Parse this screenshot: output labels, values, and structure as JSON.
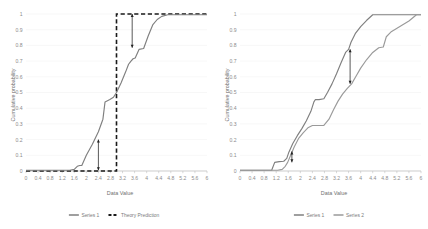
{
  "figure": {
    "panel_count": 2,
    "background": "#ffffff",
    "line_color": "#7f7f7f",
    "line_color_secondary": "#9a9a9a",
    "theory_color": "#1a1a1a",
    "gridline_color": "#f2f2f2",
    "axis_color": "#bfbfbf",
    "tick_text_color": "#8c8c8c"
  },
  "chart_data": [
    {
      "type": "line",
      "panel": "left",
      "title": "",
      "xlabel": "Data Value",
      "ylabel": "Cumulative probability",
      "xlim": [
        0,
        6
      ],
      "ylim": [
        0,
        1
      ],
      "grid": true,
      "legend_position": "bottom",
      "xticks": [
        "0",
        "0.4",
        "0.8",
        "1.2",
        "1.6",
        "2",
        "2.4",
        "2.8",
        "3.2",
        "3.6",
        "4",
        "4.4",
        "4.8",
        "5.2",
        "5.6",
        "6"
      ],
      "yticks": [
        "0",
        "0.1",
        "0.2",
        "0.3",
        "0.4",
        "0.5",
        "0.6",
        "0.7",
        "0.8",
        "0.9",
        "1"
      ],
      "series": [
        {
          "name": "Series 1",
          "style": "solid",
          "color": "#7f7f7f",
          "x": [
            0,
            0.4,
            0.8,
            1.2,
            1.45,
            1.6,
            1.7,
            1.78,
            1.85,
            2.0,
            2.2,
            2.4,
            2.55,
            2.62,
            2.78,
            2.9,
            3.0,
            3.15,
            3.3,
            3.4,
            3.48,
            3.55,
            3.62,
            3.75,
            3.9,
            4.05,
            4.2,
            4.35,
            4.5,
            4.7,
            5.0,
            5.4,
            5.8,
            6.0
          ],
          "y": [
            0.005,
            0.005,
            0.005,
            0.005,
            0.005,
            0.01,
            0.03,
            0.035,
            0.035,
            0.1,
            0.17,
            0.25,
            0.33,
            0.44,
            0.455,
            0.47,
            0.5,
            0.56,
            0.63,
            0.68,
            0.7,
            0.715,
            0.72,
            0.775,
            0.78,
            0.86,
            0.93,
            0.965,
            0.985,
            0.995,
            0.995,
            0.995,
            0.995,
            0.995
          ]
        },
        {
          "name": "Theory Prediction",
          "style": "dashed",
          "color": "#1a1a1a",
          "x": [
            0,
            3.0,
            3.0,
            6.0
          ],
          "y": [
            0.0,
            0.0,
            1.0,
            1.0
          ]
        }
      ],
      "annotations": [
        {
          "kind": "deviation-arrow",
          "x": 2.4,
          "y_from": 0.005,
          "y_to": 0.2,
          "label": ""
        },
        {
          "kind": "deviation-arrow",
          "x": 3.52,
          "y_from": 1.0,
          "y_to": 0.785,
          "label": ""
        }
      ],
      "legend": [
        {
          "label": "Series 1",
          "style": "solid",
          "color": "#7f7f7f"
        },
        {
          "label": "Theory Prediction",
          "style": "dashed",
          "color": "#1a1a1a"
        }
      ]
    },
    {
      "type": "line",
      "panel": "right",
      "title": "",
      "xlabel": "Data Value",
      "ylabel": "Cumulative probability",
      "xlim": [
        0,
        6
      ],
      "ylim": [
        0,
        1
      ],
      "grid": true,
      "legend_position": "bottom",
      "xticks": [
        "0",
        "0.4",
        "0.8",
        "1.2",
        "1.6",
        "2",
        "2.4",
        "2.8",
        "3.2",
        "3.6",
        "4",
        "4.4",
        "4.8",
        "5.2",
        "5.6",
        "6"
      ],
      "yticks": [
        "0",
        "0.1",
        "0.2",
        "0.3",
        "0.4",
        "0.5",
        "0.6",
        "0.7",
        "0.8",
        "0.9",
        "1"
      ],
      "series": [
        {
          "name": "Series 1",
          "style": "solid",
          "color": "#7f7f7f",
          "x": [
            0,
            0.4,
            0.8,
            1.05,
            1.15,
            1.3,
            1.45,
            1.55,
            1.62,
            1.75,
            1.9,
            2.05,
            2.2,
            2.35,
            2.45,
            2.5,
            2.62,
            2.78,
            2.9,
            3.05,
            3.2,
            3.35,
            3.5,
            3.6,
            3.68,
            3.82,
            4.0,
            4.2,
            4.4,
            4.55,
            4.8,
            5.2,
            5.6,
            6.0
          ],
          "y": [
            0.005,
            0.005,
            0.005,
            0.005,
            0.055,
            0.06,
            0.062,
            0.08,
            0.12,
            0.175,
            0.225,
            0.27,
            0.32,
            0.38,
            0.44,
            0.455,
            0.455,
            0.46,
            0.5,
            0.555,
            0.62,
            0.69,
            0.755,
            0.775,
            0.82,
            0.875,
            0.92,
            0.96,
            0.995,
            0.995,
            0.995,
            0.995,
            0.995,
            0.995
          ]
        },
        {
          "name": "Series 2",
          "style": "solid",
          "color": "#9a9a9a",
          "x": [
            0,
            0.4,
            0.8,
            1.1,
            1.25,
            1.4,
            1.5,
            1.58,
            1.68,
            1.8,
            1.95,
            2.1,
            2.25,
            2.4,
            2.55,
            2.65,
            2.78,
            2.95,
            3.1,
            3.25,
            3.4,
            3.55,
            3.7,
            3.85,
            4.0,
            4.2,
            4.4,
            4.6,
            4.75,
            4.85,
            5.0,
            5.3,
            5.6,
            5.85,
            6.0
          ],
          "y": [
            0.005,
            0.005,
            0.005,
            0.005,
            0.005,
            0.01,
            0.03,
            0.055,
            0.1,
            0.155,
            0.21,
            0.245,
            0.275,
            0.29,
            0.29,
            0.29,
            0.29,
            0.33,
            0.39,
            0.445,
            0.49,
            0.525,
            0.555,
            0.605,
            0.655,
            0.71,
            0.755,
            0.785,
            0.79,
            0.855,
            0.885,
            0.92,
            0.955,
            0.995,
            0.995
          ]
        }
      ],
      "annotations": [
        {
          "kind": "deviation-arrow",
          "x": 1.72,
          "y_from": 0.125,
          "y_to": 0.055,
          "label": ""
        },
        {
          "kind": "deviation-arrow",
          "x": 3.65,
          "y_from": 0.775,
          "y_to": 0.555,
          "label": ""
        }
      ],
      "legend": [
        {
          "label": "Series 1",
          "style": "solid",
          "color": "#7f7f7f"
        },
        {
          "label": "Series 2",
          "style": "solid",
          "color": "#9a9a9a"
        }
      ]
    }
  ]
}
